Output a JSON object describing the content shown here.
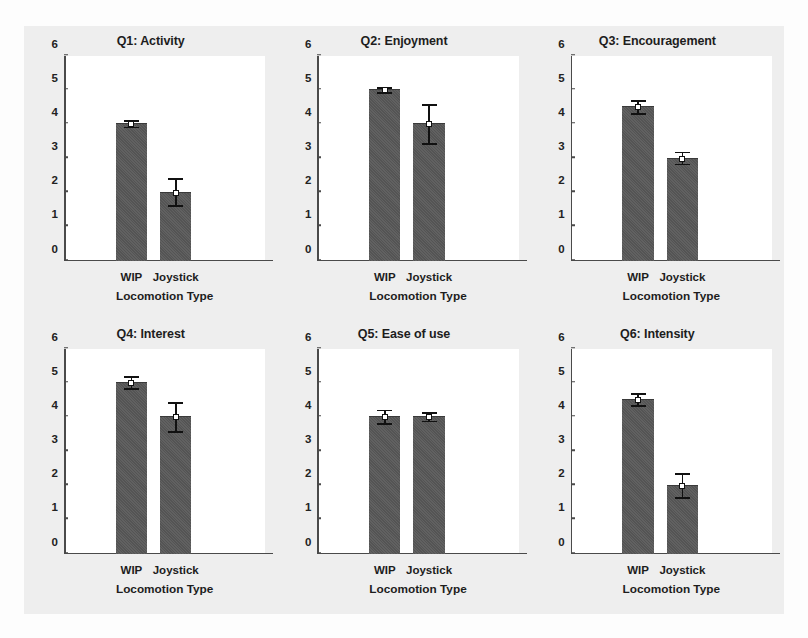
{
  "figure": {
    "background_color": "#eeeeee",
    "panel_background_color": "#ffffff",
    "bar_color": "#585858",
    "axis_color": "#4a4a4a",
    "error_bar_color": "#111111"
  },
  "chart_data": [
    {
      "type": "bar",
      "title": "Q1: Activity",
      "xlabel": "Locomotion Type",
      "ylabel": "",
      "categories": [
        "WIP",
        "Joystick"
      ],
      "values": [
        4.0,
        2.0
      ],
      "errors": [
        0.12,
        0.42
      ],
      "ylim": [
        0,
        6
      ],
      "yticks": [
        0,
        1,
        2,
        3,
        4,
        5,
        6
      ],
      "grid": false,
      "legend": "none"
    },
    {
      "type": "bar",
      "title": "Q2: Enjoyment",
      "xlabel": "Locomotion Type",
      "ylabel": "",
      "categories": [
        "WIP",
        "Joystick"
      ],
      "values": [
        5.0,
        4.0
      ],
      "errors": [
        0.1,
        0.6
      ],
      "ylim": [
        0,
        6
      ],
      "yticks": [
        0,
        1,
        2,
        3,
        4,
        5,
        6
      ],
      "grid": false,
      "legend": "none"
    },
    {
      "type": "bar",
      "title": "Q3: Encouragement",
      "xlabel": "Locomotion Type",
      "ylabel": "",
      "categories": [
        "WIP",
        "Joystick"
      ],
      "values": [
        4.5,
        3.0
      ],
      "errors": [
        0.22,
        0.2
      ],
      "ylim": [
        0,
        6
      ],
      "yticks": [
        0,
        1,
        2,
        3,
        4,
        5,
        6
      ],
      "grid": false,
      "legend": "none"
    },
    {
      "type": "bar",
      "title": "Q4: Interest",
      "xlabel": "Locomotion Type",
      "ylabel": "",
      "categories": [
        "WIP",
        "Joystick"
      ],
      "values": [
        5.0,
        4.0
      ],
      "errors": [
        0.2,
        0.45
      ],
      "ylim": [
        0,
        6
      ],
      "yticks": [
        0,
        1,
        2,
        3,
        4,
        5,
        6
      ],
      "grid": false,
      "legend": "none"
    },
    {
      "type": "bar",
      "title": "Q5: Ease of use",
      "xlabel": "Locomotion Type",
      "ylabel": "",
      "categories": [
        "WIP",
        "Joystick"
      ],
      "values": [
        4.0,
        4.0
      ],
      "errors": [
        0.23,
        0.15
      ],
      "ylim": [
        0,
        6
      ],
      "yticks": [
        0,
        1,
        2,
        3,
        4,
        5,
        6
      ],
      "grid": false,
      "legend": "none"
    },
    {
      "type": "bar",
      "title": "Q6: Intensity",
      "xlabel": "Locomotion Type",
      "ylabel": "",
      "categories": [
        "WIP",
        "Joystick"
      ],
      "values": [
        4.5,
        2.0
      ],
      "errors": [
        0.2,
        0.38
      ],
      "ylim": [
        0,
        6
      ],
      "yticks": [
        0,
        1,
        2,
        3,
        4,
        5,
        6
      ],
      "grid": false,
      "legend": "none"
    }
  ]
}
